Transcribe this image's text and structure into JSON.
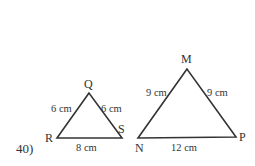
{
  "problem": {
    "number": "40)"
  },
  "triangles": [
    {
      "name": "QRS",
      "vertices": {
        "top": "Q",
        "left": "R",
        "right": "S"
      },
      "sides": {
        "left": "6 cm",
        "right": "6 cm",
        "base": "8 cm"
      }
    },
    {
      "name": "MNP",
      "vertices": {
        "top": "M",
        "left": "N",
        "right": "P"
      },
      "sides": {
        "left": "9 cm",
        "right": "9 cm",
        "base": "12 cm"
      }
    }
  ],
  "colors": {
    "stroke": "#333333",
    "background": "#ffffff"
  }
}
